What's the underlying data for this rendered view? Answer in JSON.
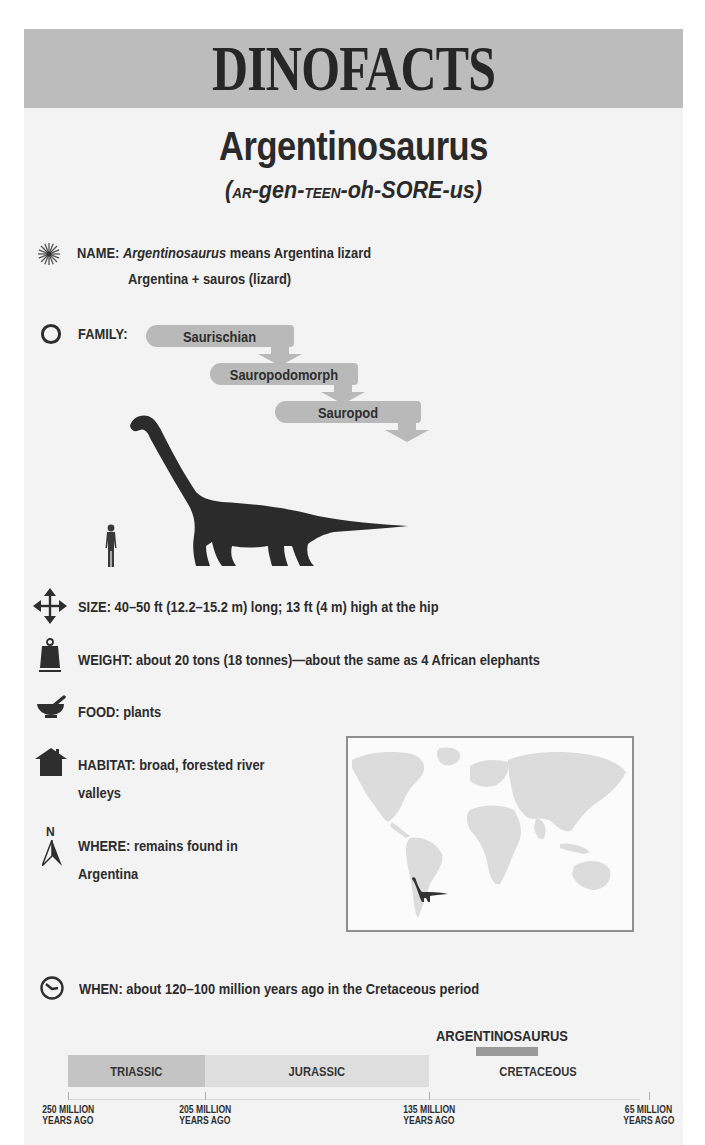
{
  "header": {
    "title": "DINOFACTS"
  },
  "species": {
    "name": "Argentinosaurus",
    "pronunciation": [
      {
        "text": "(",
        "style": "big"
      },
      {
        "text": "AR",
        "style": "sc"
      },
      {
        "text": "-gen-",
        "style": "big"
      },
      {
        "text": "TEEN",
        "style": "sc"
      },
      {
        "text": "-oh-SORE-",
        "style": "big"
      },
      {
        "text": "us)",
        "style": "big"
      }
    ],
    "pronunciation_full": "(AR-gen-TEEN-oh-SORE-us)"
  },
  "facts": {
    "name": {
      "icon": "sun-burst-icon",
      "label": "NAME:",
      "italic_term": "Argentinosaurus",
      "text": "means Argentina lizard",
      "line2": "Argentina + sauros (lizard)"
    },
    "family": {
      "icon": "circle-outline-icon",
      "label": "FAMILY:",
      "tags": [
        "Saurischian",
        "Sauropodomorph",
        "Sauropod"
      ]
    },
    "size": {
      "icon": "four-way-arrows-icon",
      "label": "SIZE:",
      "text": "40–50 ft (12.2–15.2 m) long; 13 ft (4 m) high at the hip"
    },
    "weight": {
      "icon": "weight-icon",
      "label": "WEIGHT:",
      "text": "about 20 tons (18 tonnes)—about the same as 4 African elephants"
    },
    "food": {
      "icon": "mortar-pestle-icon",
      "label": "FOOD:",
      "text": "plants"
    },
    "habitat": {
      "icon": "house-icon",
      "label": "HABITAT:",
      "text": "broad, forested river",
      "line2": "valleys"
    },
    "where": {
      "icon": "north-compass-icon",
      "compass_letter": "N",
      "label": "WHERE:",
      "text": "remains found in",
      "line2": "Argentina"
    },
    "when": {
      "icon": "clock-dinosaur-icon",
      "label": "WHEN:",
      "text": "about 120–100 million years ago in the Cretaceous period"
    }
  },
  "timeline": {
    "highlight_label": "ARGENTINOSAURUS",
    "periods": [
      {
        "name": "TRIASSIC",
        "color": "#c4c4c4"
      },
      {
        "name": "JURASSIC",
        "color": "#dedede"
      },
      {
        "name": "CRETACEOUS",
        "color": "#f3f3f3"
      }
    ],
    "ticks": [
      {
        "line1": "250 MILLION",
        "line2": "YEARS AGO"
      },
      {
        "line1": "205 MILLION",
        "line2": "YEARS AGO"
      },
      {
        "line1": "135 MILLION",
        "line2": "YEARS AGO"
      },
      {
        "line1": "65 MILLION",
        "line2": "YEARS AGO"
      }
    ]
  },
  "colors": {
    "header_bg": "#bcbcbc",
    "card_bg": "#f3f3f3",
    "tag_bg": "#b9b9b9",
    "silhouette": "#2b2b2b",
    "text": "#2a2a2a"
  }
}
